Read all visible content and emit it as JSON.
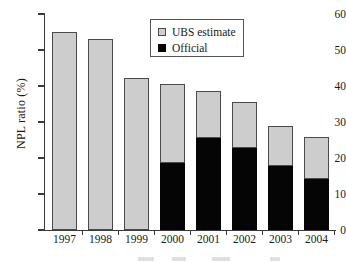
{
  "chart_data": {
    "type": "bar",
    "stacked": true,
    "title": "",
    "xlabel": "",
    "ylabel": "NPL ratio (%)",
    "ylim": [
      0,
      60
    ],
    "yticks": [
      0,
      10,
      20,
      30,
      40,
      50,
      60
    ],
    "grid": false,
    "legend_position": "top-center",
    "categories": [
      "1997",
      "1998",
      "1999",
      "2000",
      "2001",
      "2002",
      "2003",
      "2004"
    ],
    "series": [
      {
        "name": "Official",
        "color": "#050505",
        "values": [
          null,
          null,
          null,
          18.6,
          25.5,
          22.7,
          17.9,
          14.3
        ]
      },
      {
        "name": "UBS estimate",
        "color": "#cdcdcd",
        "values": [
          55.0,
          53.0,
          42.3,
          21.9,
          13.0,
          12.8,
          10.9,
          11.5
        ]
      }
    ],
    "totals": [
      55.0,
      53.0,
      42.3,
      40.5,
      38.5,
      35.5,
      28.8,
      25.8
    ]
  },
  "legend": {
    "items": [
      {
        "label": "UBS estimate",
        "swatch": "gray-square-icon"
      },
      {
        "label": "Official",
        "swatch": "black-square-icon"
      }
    ]
  },
  "axes": {
    "y_label": "NPL ratio (%)",
    "y_tick_labels": [
      "0",
      "10",
      "20",
      "30",
      "40",
      "50",
      "60"
    ],
    "x_tick_labels": [
      "1997",
      "1998",
      "1999",
      "2000",
      "2001",
      "2002",
      "2003",
      "2004"
    ]
  }
}
